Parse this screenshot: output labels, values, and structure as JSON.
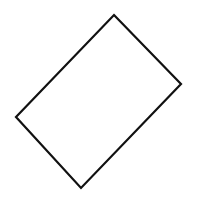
{
  "diagram": {
    "title": "",
    "background_color": "#ffffff",
    "shapes": [
      {
        "id": "rotated-rectangle",
        "kind": "quadrilateral",
        "description": "rectangle rotated about 45 degrees, outline only",
        "stroke_color": "#111111",
        "fill_color": "none",
        "vertex_order": [
          "top",
          "right",
          "bottom",
          "left"
        ]
      }
    ]
  }
}
